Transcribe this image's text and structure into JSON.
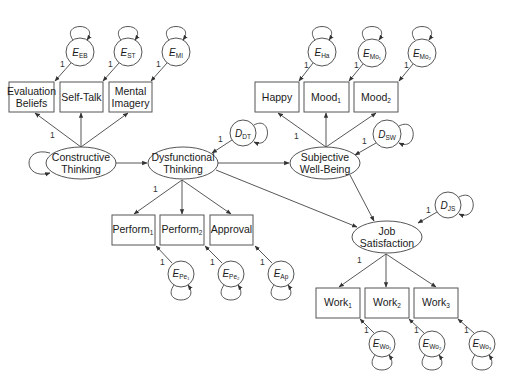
{
  "diagram": {
    "type": "structural-equation-model",
    "latent_variables": [
      {
        "id": "ct",
        "line1": "Constructive",
        "line2": "Thinking",
        "cx": 81,
        "cy": 163
      },
      {
        "id": "dt",
        "line1": "Dysfunctional",
        "line2": "Thinking",
        "cx": 183,
        "cy": 163
      },
      {
        "id": "sw",
        "line1": "Subjective",
        "line2": "Well-Being",
        "cx": 325,
        "cy": 163
      },
      {
        "id": "js",
        "line1": "Job",
        "line2": "Satisfaction",
        "cx": 387,
        "cy": 237
      }
    ],
    "indicators": {
      "evaluation_beliefs": {
        "line1": "Evaluation",
        "line2": "Beliefs"
      },
      "self_talk": {
        "label": "Self-Talk"
      },
      "mental_imagery": {
        "line1": "Mental",
        "line2": "Imagery"
      },
      "happy": {
        "label": "Happy"
      },
      "mood1": {
        "base": "Mood",
        "sub": "1"
      },
      "mood2": {
        "base": "Mood",
        "sub": "2"
      },
      "perform1": {
        "base": "Perform",
        "sub": "1"
      },
      "perform2": {
        "base": "Perform",
        "sub": "2"
      },
      "approval": {
        "label": "Approval"
      },
      "work1": {
        "base": "Work",
        "sub": "1"
      },
      "work2": {
        "base": "Work",
        "sub": "2"
      },
      "work3": {
        "base": "Work",
        "sub": "3"
      }
    },
    "errors": {
      "e_eb": {
        "base": "E",
        "sub": "EB"
      },
      "e_st": {
        "base": "E",
        "sub": "ST"
      },
      "e_mi": {
        "base": "E",
        "sub": "MI"
      },
      "e_ha": {
        "base": "E",
        "sub": "Ha"
      },
      "e_mo1": {
        "base": "E",
        "sub": "Mo₁"
      },
      "e_mo2": {
        "base": "E",
        "sub": "Mo₂"
      },
      "e_pe1": {
        "base": "E",
        "sub": "Pe₁"
      },
      "e_pe2": {
        "base": "E",
        "sub": "Pe₂"
      },
      "e_ap": {
        "base": "E",
        "sub": "Ap"
      },
      "e_wo1": {
        "base": "E",
        "sub": "Wo₁"
      },
      "e_wo2": {
        "base": "E",
        "sub": "Wo₂"
      },
      "e_wo3": {
        "base": "E",
        "sub": "Wo₃"
      }
    },
    "disturbances": {
      "d_dt": {
        "base": "D",
        "sub": "DT"
      },
      "d_sw": {
        "base": "D",
        "sub": "SW"
      },
      "d_js": {
        "base": "D",
        "sub": "JS"
      }
    },
    "path_label": "1",
    "structural_paths": [
      {
        "from": "Constructive Thinking",
        "to": "Dysfunctional Thinking"
      },
      {
        "from": "Dysfunctional Thinking",
        "to": "Subjective Well-Being"
      },
      {
        "from": "Dysfunctional Thinking",
        "to": "Job Satisfaction"
      },
      {
        "from": "Subjective Well-Being",
        "to": "Job Satisfaction"
      }
    ],
    "colors": {
      "stroke": "#555555",
      "background": "#ffffff",
      "text": "#1a1a1a"
    }
  }
}
